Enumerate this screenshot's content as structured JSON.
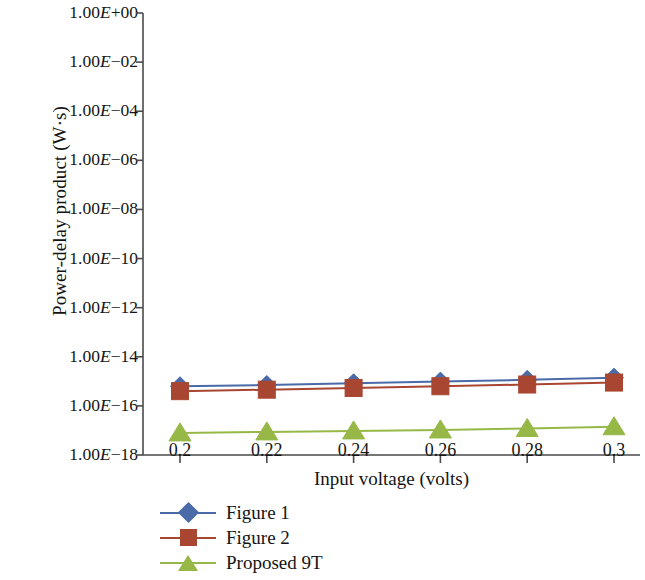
{
  "chart_data": {
    "type": "line",
    "title": "",
    "xlabel": "Input voltage (volts)",
    "ylabel": "Power-delay product (W·s)",
    "x": [
      0.2,
      0.22,
      0.24,
      0.26,
      0.28,
      0.3
    ],
    "xtick_labels": [
      "0.2",
      "0.22",
      "0.24",
      "0.26",
      "0.28",
      "0.3"
    ],
    "ytick_labels": [
      "1.00E+00",
      "1.00E−02",
      "1.00E−04",
      "1.00E−06",
      "1.00E−08",
      "1.00E−10",
      "1.00E−12",
      "1.00E−14",
      "1.00E−16",
      "1.00E−18"
    ],
    "ytick_mantissa": "1.00",
    "ytick_exponents": [
      "+00",
      "−02",
      "−04",
      "−06",
      "−08",
      "−10",
      "−12",
      "−14",
      "−16",
      "−18"
    ],
    "yscale": "log",
    "ylim": [
      1e-18,
      1.0
    ],
    "grid": false,
    "legend_position": "below",
    "series": [
      {
        "name": "Figure 1",
        "color": "#4a6ba8",
        "marker": "diamond",
        "values": [
          6.3e-16,
          7.1e-16,
          8.3e-16,
          9.8e-16,
          1.15e-15,
          1.4e-15
        ],
        "log_values": [
          -15.2,
          -15.15,
          -15.08,
          -15.01,
          -14.94,
          -14.85
        ]
      },
      {
        "name": "Figure 2",
        "color": "#a84632",
        "marker": "square",
        "values": [
          4e-16,
          4.6e-16,
          5.4e-16,
          6.3e-16,
          7.4e-16,
          8.9e-16
        ],
        "log_values": [
          -15.4,
          -15.34,
          -15.27,
          -15.2,
          -15.13,
          -15.05
        ]
      },
      {
        "name": "Proposed 9T",
        "color": "#97b847",
        "marker": "triangle",
        "values": [
          7.9e-18,
          8.7e-18,
          9.5e-18,
          1.05e-17,
          1.2e-17,
          1.4e-17
        ],
        "log_values": [
          -17.1,
          -17.06,
          -17.02,
          -16.98,
          -16.92,
          -16.85
        ]
      }
    ]
  },
  "legend": {
    "items": [
      {
        "label": "Figure 1",
        "color": "#4a6ba8",
        "marker": "diamond"
      },
      {
        "label": "Figure 2",
        "color": "#a84632",
        "marker": "square"
      },
      {
        "label": "Proposed 9T",
        "color": "#97b847",
        "marker": "triangle"
      }
    ]
  },
  "axes": {
    "y_title": "Power-delay product (W·s)",
    "x_title": "Input voltage (volts)"
  }
}
